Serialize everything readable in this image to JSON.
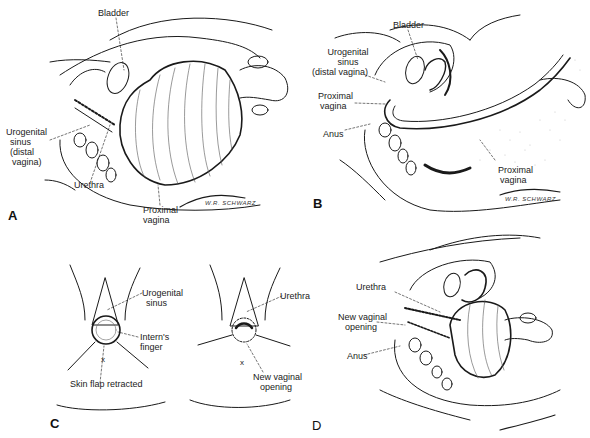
{
  "figure": {
    "panels": [
      {
        "id": "A",
        "letter": "A",
        "labels": {
          "bladder": "Bladder",
          "urogenital_sinus_1": "Urogenital",
          "urogenital_sinus_2": "sinus",
          "urogenital_sinus_3": "(distal",
          "urogenital_sinus_4": "vagina)",
          "urethra": "Urethra",
          "proximal_vagina_1": "Proximal",
          "proximal_vagina_2": "vagina"
        },
        "signature": "W.R. SCHWARZ"
      },
      {
        "id": "B",
        "letter": "B",
        "labels": {
          "bladder": "Bladder",
          "urogenital_sinus_1": "Urogenital",
          "urogenital_sinus_2": "sinus",
          "urogenital_sinus_3": "(distal vagina)",
          "proximal_vagina_upper_1": "Proximal",
          "proximal_vagina_upper_2": "vagina",
          "anus": "Anus",
          "proximal_vagina_lower_1": "Proximal",
          "proximal_vagina_lower_2": "vagina"
        },
        "signature": "W.R. SCHWARZ"
      },
      {
        "id": "C",
        "letter": "C",
        "left_labels": {
          "urogenital_sinus_1": "Urogenital",
          "urogenital_sinus_2": "sinus",
          "interns_finger_1": "Intern's",
          "interns_finger_2": "finger",
          "skin_flap": "Skin flap retracted"
        },
        "right_labels": {
          "urethra": "Urethra",
          "new_vaginal_opening_1": "New vaginal",
          "new_vaginal_opening_2": "opening"
        }
      },
      {
        "id": "D",
        "letter": "D",
        "labels": {
          "urethra": "Urethra",
          "new_vaginal_opening_1": "New vaginal",
          "new_vaginal_opening_2": "opening",
          "anus": "Anus"
        }
      }
    ]
  }
}
